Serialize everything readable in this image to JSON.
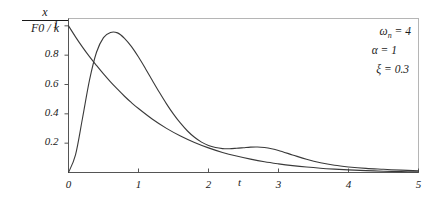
{
  "chart_data": {
    "type": "line",
    "title": "",
    "subtitle": "",
    "xlabel": "t",
    "ylabel_numerator": "x",
    "ylabel_denominator": "F0 / k",
    "ylabel": "x / (F0 / k)",
    "xlim": [
      0,
      5
    ],
    "ylim": [
      0,
      1.05
    ],
    "xticks": [
      0,
      1,
      2,
      3,
      4,
      5
    ],
    "xtick_labels": [
      "0",
      "1",
      "2",
      "3",
      "4",
      "5"
    ],
    "yticks": [
      0.2,
      0.4,
      0.6,
      0.8,
      1
    ],
    "ytick_labels": [
      "0.2",
      "0.4",
      "0.6",
      "0.8",
      "1"
    ],
    "grid": false,
    "legend": false,
    "legend_position": "none",
    "frame": true,
    "line_color": "#3a3a3a",
    "axis_color": "#555555",
    "frame_color": "#b5b5b5",
    "annotations": [
      {
        "id": "omega_n",
        "symbol": "ω",
        "subscript": "n",
        "relation": "=",
        "value": "4",
        "text": "ωn = 4"
      },
      {
        "id": "alpha",
        "symbol": "α",
        "subscript": "",
        "relation": "=",
        "value": "1",
        "text": "α = 1"
      },
      {
        "id": "xi",
        "symbol": "ξ",
        "subscript": "",
        "relation": "=",
        "value": "0.3",
        "text": "ξ = 0.3"
      }
    ],
    "series": [
      {
        "name": "exponential-decay",
        "x": [
          0,
          0.1,
          0.2,
          0.3,
          0.4,
          0.5,
          0.6,
          0.7,
          0.8,
          0.9,
          1.0,
          1.2,
          1.4,
          1.6,
          1.8,
          2.0,
          2.2,
          2.4,
          2.6,
          2.8,
          3.0,
          3.2,
          3.4,
          3.6,
          3.8,
          4.0,
          4.25,
          4.5,
          4.75,
          5.0
        ],
        "values": [
          1.0,
          0.925,
          0.855,
          0.79,
          0.73,
          0.672,
          0.618,
          0.568,
          0.52,
          0.476,
          0.436,
          0.363,
          0.301,
          0.249,
          0.205,
          0.168,
          0.137,
          0.112,
          0.091,
          0.073,
          0.059,
          0.047,
          0.037,
          0.029,
          0.023,
          0.018,
          0.013,
          0.009,
          0.006,
          0.004
        ]
      },
      {
        "name": "underdamped-oscillation",
        "x": [
          0,
          0.1,
          0.2,
          0.3,
          0.4,
          0.5,
          0.6,
          0.7,
          0.8,
          0.9,
          1.0,
          1.1,
          1.2,
          1.3,
          1.4,
          1.5,
          1.6,
          1.7,
          1.8,
          1.9,
          2.0,
          2.1,
          2.2,
          2.3,
          2.4,
          2.5,
          2.6,
          2.7,
          2.8,
          2.9,
          3.0,
          3.2,
          3.4,
          3.6,
          3.8,
          4.0,
          4.25,
          4.5,
          4.75,
          5.0
        ],
        "values": [
          0.0,
          0.12,
          0.37,
          0.63,
          0.82,
          0.92,
          0.955,
          0.952,
          0.915,
          0.858,
          0.787,
          0.708,
          0.626,
          0.545,
          0.468,
          0.398,
          0.336,
          0.283,
          0.24,
          0.207,
          0.184,
          0.17,
          0.163,
          0.162,
          0.165,
          0.169,
          0.173,
          0.174,
          0.17,
          0.162,
          0.15,
          0.12,
          0.09,
          0.066,
          0.049,
          0.038,
          0.028,
          0.022,
          0.016,
          0.012
        ],
        "peak": {
          "x": 0.68,
          "y": 0.955
        },
        "secondary_bump": {
          "x": 2.3,
          "y": 0.17
        }
      }
    ]
  }
}
